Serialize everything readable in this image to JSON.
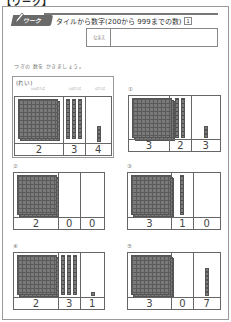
{
  "top_label": "【ワーク】",
  "header": {
    "badge": "ワーク",
    "title": "タイルから数字(200から 999までの数)",
    "sheet_number": "1"
  },
  "name_field": {
    "label": "なまえ",
    "value": ""
  },
  "instruction": "つぎの 数を かきましょう。",
  "example": {
    "title": "(れい)",
    "column_headers": [
      "100のたば",
      "10のたば",
      "1のたば"
    ],
    "hundreds": 2,
    "tens": 3,
    "ones": 4,
    "digits": [
      "2",
      "3",
      "4"
    ]
  },
  "problems": [
    {
      "label": "①",
      "hundreds": 3,
      "tens": 2,
      "ones": 3,
      "digits": [
        "3",
        "2",
        "3"
      ]
    },
    {
      "label": "②",
      "hundreds": 2,
      "tens": 0,
      "ones": 0,
      "digits": [
        "2",
        "0",
        "0"
      ]
    },
    {
      "label": "③",
      "hundreds": 3,
      "tens": 1,
      "ones": 0,
      "digits": [
        "3",
        "1",
        "0"
      ]
    },
    {
      "label": "④",
      "hundreds": 2,
      "tens": 3,
      "ones": 1,
      "digits": [
        "2",
        "3",
        "1"
      ]
    },
    {
      "label": "⑤",
      "hundreds": 3,
      "tens": 0,
      "ones": 7,
      "digits": [
        "3",
        "0",
        "7"
      ]
    }
  ],
  "colors": {
    "tile_fill": "#7a7a7a",
    "tile_grid": "#5a5a5a",
    "border": "#666666",
    "badge_bg": "#6a6a6a"
  }
}
